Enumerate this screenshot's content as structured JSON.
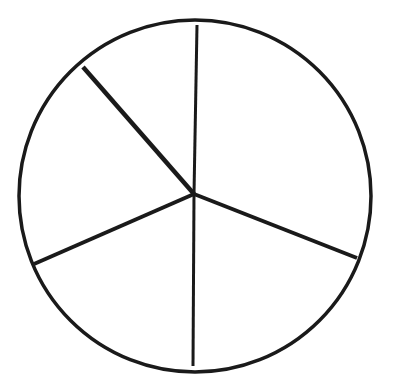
{
  "diagram": {
    "type": "circle-divided-into-sectors",
    "sector_count": 5,
    "stroke_color": "#1a1a1a",
    "background": "#ffffff",
    "circle": {
      "cx": 195,
      "cy": 196,
      "r": 176
    },
    "center": {
      "x": 194,
      "y": 194
    },
    "radii": [
      {
        "name": "radius-top",
        "x": 197,
        "y": 25,
        "width": 3
      },
      {
        "name": "radius-upper-left",
        "x": 83,
        "y": 67,
        "width": 4.5
      },
      {
        "name": "radius-lower-left",
        "x": 34,
        "y": 264,
        "width": 4
      },
      {
        "name": "radius-bottom",
        "x": 193,
        "y": 366,
        "width": 3
      },
      {
        "name": "radius-lower-right",
        "x": 357,
        "y": 258,
        "width": 4
      }
    ]
  }
}
